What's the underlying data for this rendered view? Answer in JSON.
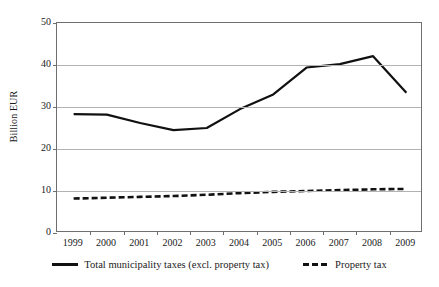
{
  "chart_data": {
    "type": "line",
    "title": "",
    "xlabel": "",
    "ylabel": "Billion EUR",
    "categories": [
      "1999",
      "2000",
      "2001",
      "2002",
      "2003",
      "2004",
      "2005",
      "2006",
      "2007",
      "2008",
      "2009"
    ],
    "ylim": [
      0,
      50
    ],
    "yticks": [
      0,
      10,
      20,
      30,
      40,
      50
    ],
    "ytick_labels": [
      "0",
      "10",
      "20",
      "30",
      "40",
      "50"
    ],
    "grid": true,
    "legend_position": "bottom",
    "series": [
      {
        "name": "Total municipality taxes (excl. property tax)",
        "style": "solid",
        "color": "#111111",
        "values": [
          28.3,
          28.2,
          26.2,
          24.5,
          25.0,
          29.5,
          33.0,
          39.4,
          40.2,
          42.1,
          33.4
        ]
      },
      {
        "name": "Property tax",
        "style": "dashed",
        "color": "#111111",
        "values": [
          8.2,
          8.4,
          8.6,
          8.8,
          9.1,
          9.5,
          9.8,
          10.0,
          10.2,
          10.4,
          10.5
        ]
      }
    ]
  },
  "axes": {
    "y_title": "Billion EUR"
  },
  "legend": {
    "entries": [
      {
        "label": "Total municipality taxes (excl. property tax)"
      },
      {
        "label": "Property tax"
      }
    ]
  }
}
